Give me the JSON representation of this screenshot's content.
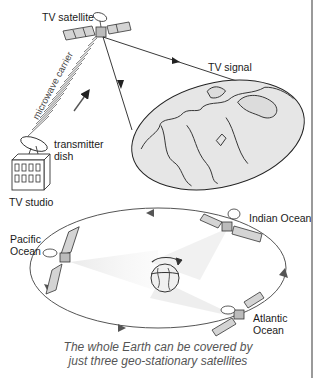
{
  "diagram": {
    "top_section": {
      "satellite_label": "TV satellite",
      "carrier_label": "microwave carrier",
      "signal_label": "TV signal",
      "dish_label_line1": "transmitter",
      "dish_label_line2": "dish",
      "studio_label": "TV studio"
    },
    "bottom_section": {
      "satellites": [
        {
          "label_line1": "Pacific",
          "label_line2": "Ocean"
        },
        {
          "label_line1": "Indian Ocean",
          "label_line2": ""
        },
        {
          "label_line1": "Atlantic",
          "label_line2": "Ocean"
        }
      ]
    },
    "caption_line1": "The whole Earth can be covered by",
    "caption_line2": "just three geo-stationary satellites",
    "colors": {
      "line": "#333333",
      "map_fill": "#e6e6e6",
      "panel_fill": "#d4d4d4",
      "beam": "#ececec",
      "rule": "#9a9a9a"
    }
  }
}
